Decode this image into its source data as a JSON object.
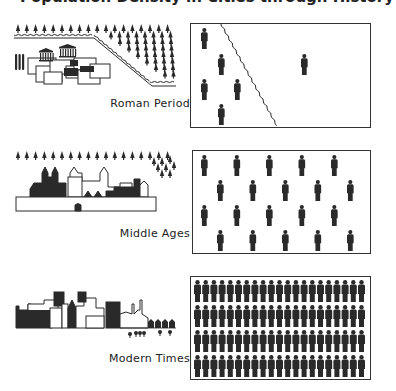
{
  "title": "Population Density in Cities through History",
  "colors": {
    "ink": "#2a2a2a",
    "paper": "#ffffff",
    "border": "#333333"
  },
  "periods": [
    {
      "id": "roman",
      "label": "Roman Period",
      "people_inside_wall": 6,
      "people_outside_wall": 1,
      "layout": "sparse, divided by city wall"
    },
    {
      "id": "middle",
      "label": "Middle Ages",
      "rows": 4,
      "per_row": 5,
      "people_total": 20,
      "layout": "staggered grid"
    },
    {
      "id": "modern",
      "label": "Modern Times",
      "rows": 4,
      "per_row": 21,
      "people_total": 84,
      "layout": "dense packed rows"
    }
  ]
}
